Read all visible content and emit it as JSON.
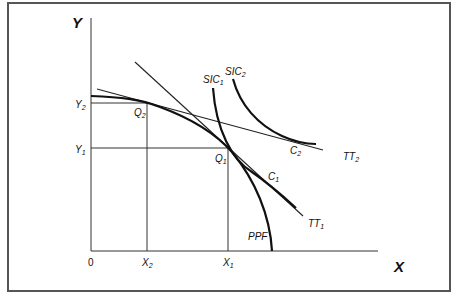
{
  "diagram": {
    "type": "trade-equilibrium",
    "axes": {
      "x_label": "X",
      "y_label": "Y",
      "origin_label": "0"
    },
    "ticks": {
      "x": [
        {
          "label": "X",
          "sub": "2"
        },
        {
          "label": "X",
          "sub": "1"
        }
      ],
      "y": [
        {
          "label": "Y",
          "sub": "2"
        },
        {
          "label": "Y",
          "sub": "1"
        }
      ]
    },
    "points": [
      {
        "label": "Q",
        "sub": "2"
      },
      {
        "label": "Q",
        "sub": "1"
      },
      {
        "label": "C",
        "sub": "1"
      },
      {
        "label": "C",
        "sub": "2"
      }
    ],
    "curves": [
      {
        "label": "PPF",
        "sub": ""
      },
      {
        "label": "SIC",
        "sub": "1"
      },
      {
        "label": "SIC",
        "sub": "2"
      },
      {
        "label": "TT",
        "sub": "1"
      },
      {
        "label": "TT",
        "sub": "2"
      }
    ],
    "colors": {
      "ink": "#111111",
      "frame": "#555555",
      "background": "#ffffff"
    }
  }
}
